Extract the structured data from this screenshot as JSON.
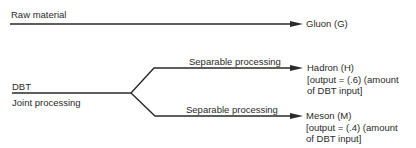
{
  "diagram": {
    "raw_material": {
      "label": "Raw material",
      "output": "Gluon (G)"
    },
    "joint": {
      "input_label": "DBT",
      "process_label": "Joint processing"
    },
    "branches": [
      {
        "process_label": "Separable processing",
        "product": "Hadron (H)",
        "note_line1": "[output = (.6) (amount",
        "note_line2": "of DBT input]"
      },
      {
        "process_label": "Separable processing",
        "product": "Meson (M)",
        "note_line1": "[output = (.4) (amount",
        "note_line2": "of DBT input]"
      }
    ],
    "colors": {
      "line": "#2a2a2a",
      "text": "#2a2a2a",
      "background": "#ffffff"
    }
  }
}
